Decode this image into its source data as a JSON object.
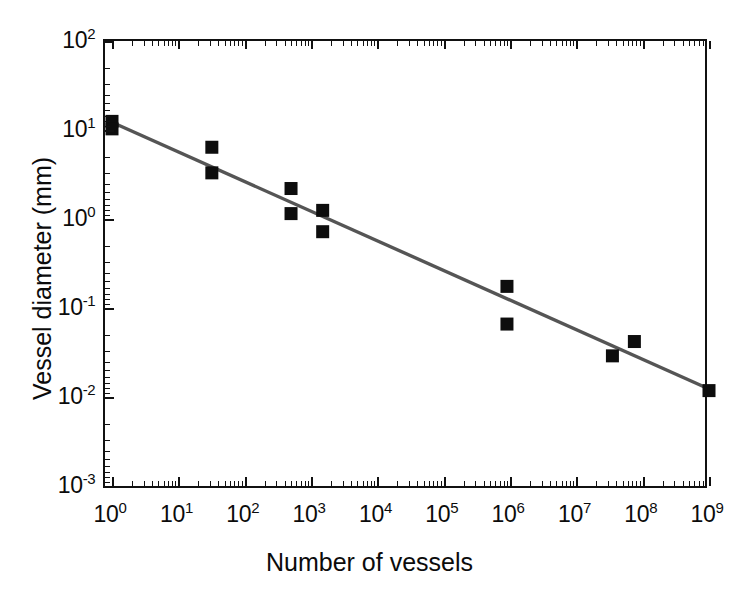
{
  "chart_data": {
    "type": "scatter",
    "title": "",
    "xlabel": "Number of vessels",
    "ylabel": "Vessel diameter (mm)",
    "xscale": "log",
    "yscale": "log",
    "xlim": [
      1,
      1000000000
    ],
    "ylim": [
      0.001,
      100
    ],
    "grid": false,
    "legend": null,
    "xticks": [
      {
        "value": 1,
        "label": "10",
        "exponent": "0"
      },
      {
        "value": 10,
        "label": "10",
        "exponent": "1"
      },
      {
        "value": 100,
        "label": "10",
        "exponent": "2"
      },
      {
        "value": 1000,
        "label": "10",
        "exponent": "3"
      },
      {
        "value": 10000,
        "label": "10",
        "exponent": "4"
      },
      {
        "value": 100000,
        "label": "10",
        "exponent": "5"
      },
      {
        "value": 1000000,
        "label": "10",
        "exponent": "6"
      },
      {
        "value": 10000000,
        "label": "10",
        "exponent": "7"
      },
      {
        "value": 100000000,
        "label": "10",
        "exponent": "8"
      },
      {
        "value": 1000000000,
        "label": "10",
        "exponent": "9"
      }
    ],
    "yticks": [
      {
        "value": 100,
        "label": "10",
        "exponent": "2"
      },
      {
        "value": 10,
        "label": "10",
        "exponent": "1"
      },
      {
        "value": 1,
        "label": "10",
        "exponent": "0"
      },
      {
        "value": 0.1,
        "label": "10",
        "exponent": "-1"
      },
      {
        "value": 0.01,
        "label": "10",
        "exponent": "-2"
      },
      {
        "value": 0.001,
        "label": "10",
        "exponent": "-3"
      }
    ],
    "series": [
      {
        "name": "Vessel measurements",
        "marker": "square",
        "color": "#0d0d0d",
        "points": [
          {
            "x": 1,
            "y": 12.5
          },
          {
            "x": 1,
            "y": 10.3
          },
          {
            "x": 32,
            "y": 6.4
          },
          {
            "x": 32,
            "y": 3.3
          },
          {
            "x": 500,
            "y": 2.2
          },
          {
            "x": 500,
            "y": 1.15
          },
          {
            "x": 1500,
            "y": 1.25
          },
          {
            "x": 1500,
            "y": 0.72
          },
          {
            "x": 900000,
            "y": 0.175
          },
          {
            "x": 900000,
            "y": 0.066
          },
          {
            "x": 35000000,
            "y": 0.029
          },
          {
            "x": 75000000,
            "y": 0.042
          },
          {
            "x": 1000000000,
            "y": 0.0118
          }
        ]
      }
    ],
    "fit_line": {
      "name": "Power-law fit",
      "color": "#555555",
      "x_start": 1,
      "y_start": 12.2,
      "x_end": 1000000000,
      "y_end": 0.0123
    }
  }
}
